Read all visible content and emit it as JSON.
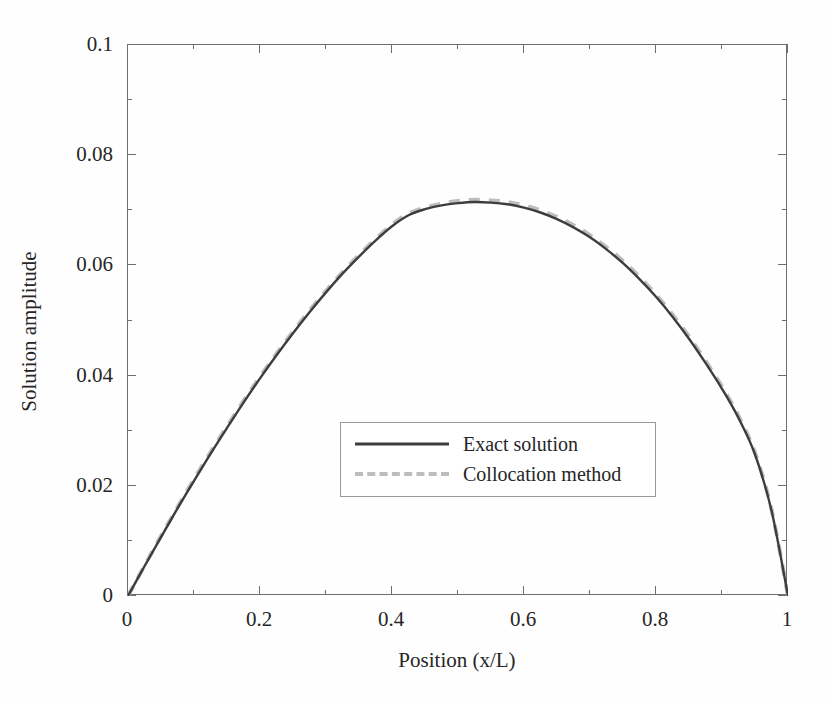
{
  "chart_data": {
    "type": "line",
    "title": "",
    "xlabel": "Position (x/L)",
    "ylabel": "Solution amplitude",
    "xlim": [
      0,
      1
    ],
    "ylim": [
      0,
      0.1
    ],
    "grid": false,
    "legend_position": "center",
    "xticks": [
      "0",
      "0.2",
      "0.4",
      "0.6",
      "0.8",
      "1"
    ],
    "xtick_values": [
      0,
      0.2,
      0.4,
      0.6,
      0.8,
      1
    ],
    "yticks": [
      "0",
      "0.02",
      "0.04",
      "0.06",
      "0.08",
      "0.1"
    ],
    "ytick_values": [
      0,
      0.02,
      0.04,
      0.06,
      0.08,
      0.1
    ],
    "x": [
      0,
      0.025,
      0.05,
      0.075,
      0.1,
      0.125,
      0.15,
      0.175,
      0.2,
      0.225,
      0.25,
      0.275,
      0.3,
      0.325,
      0.35,
      0.375,
      0.4,
      0.425,
      0.45,
      0.475,
      0.5,
      0.525,
      0.55,
      0.575,
      0.6,
      0.625,
      0.65,
      0.675,
      0.7,
      0.725,
      0.75,
      0.775,
      0.8,
      0.825,
      0.85,
      0.875,
      0.9,
      0.925,
      0.95,
      0.975,
      1
    ],
    "series": [
      {
        "name": "Exact solution",
        "style": "solid",
        "color": "#3d3d3d",
        "values": [
          0,
          0.0054,
          0.0107,
          0.0159,
          0.0209,
          0.0258,
          0.0305,
          0.0351,
          0.0395,
          0.0437,
          0.0477,
          0.0515,
          0.0551,
          0.0585,
          0.0616,
          0.0645,
          0.0671,
          0.0691,
          0.0702,
          0.0709,
          0.0713,
          0.0715,
          0.0714,
          0.0711,
          0.0705,
          0.0696,
          0.0684,
          0.0669,
          0.0651,
          0.0629,
          0.0604,
          0.0575,
          0.0543,
          0.0507,
          0.0467,
          0.0423,
          0.0376,
          0.0323,
          0.0257,
          0.0155,
          0
        ]
      },
      {
        "name": "Collocation method",
        "style": "dashed",
        "color": "#bdbdbd",
        "values": [
          0,
          0.0055,
          0.0109,
          0.0161,
          0.0212,
          0.0261,
          0.0308,
          0.0354,
          0.0398,
          0.044,
          0.048,
          0.0518,
          0.0554,
          0.0588,
          0.0619,
          0.0648,
          0.0674,
          0.0694,
          0.0705,
          0.0712,
          0.0717,
          0.0719,
          0.0718,
          0.0715,
          0.0709,
          0.07,
          0.0688,
          0.0673,
          0.0655,
          0.0633,
          0.0608,
          0.0579,
          0.0547,
          0.0511,
          0.0471,
          0.0427,
          0.038,
          0.0327,
          0.026,
          0.0157,
          0
        ]
      }
    ]
  },
  "legend": {
    "items": [
      {
        "label": "Exact solution",
        "style": "solid"
      },
      {
        "label": "Collocation method",
        "style": "dashed"
      }
    ]
  },
  "colors": {
    "exact": "#3d3d3d",
    "collocation": "#bdbdbd",
    "axis": "#6e6e6e",
    "text": "#262626",
    "background": "#fefefe"
  }
}
